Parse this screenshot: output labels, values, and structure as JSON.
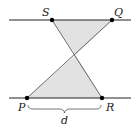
{
  "diagram": {
    "points": {
      "S": {
        "label": "S",
        "x": 52,
        "y": 20
      },
      "Q": {
        "label": "Q",
        "x": 112,
        "y": 20
      },
      "P": {
        "label": "P",
        "x": 27,
        "y": 98
      },
      "R": {
        "label": "R",
        "x": 102,
        "y": 98
      }
    },
    "distance_label": "d",
    "colors": {
      "line": "#222222",
      "fill": "#e2e2e2",
      "point": "#000000"
    }
  }
}
